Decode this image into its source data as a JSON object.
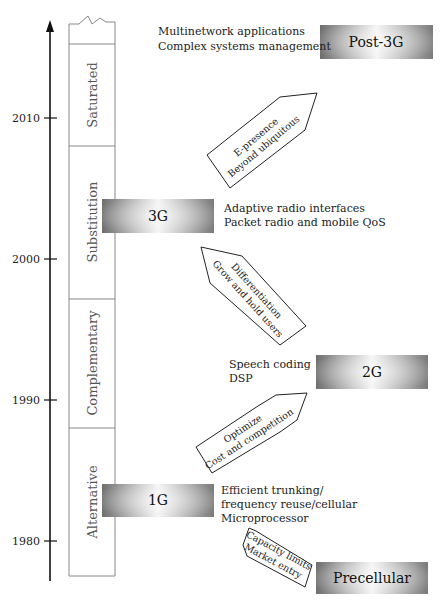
{
  "diagram": {
    "axis": {
      "ticks": [
        {
          "label": "2010",
          "y": 118
        },
        {
          "label": "2000",
          "y": 259
        },
        {
          "label": "1990",
          "y": 400
        },
        {
          "label": "1980",
          "y": 541
        }
      ]
    },
    "phases": [
      {
        "label": "Saturated",
        "y_top": 44,
        "y_bottom": 146
      },
      {
        "label": "Substitution",
        "y_top": 146,
        "y_bottom": 299
      },
      {
        "label": "Complementary",
        "y_top": 299,
        "y_bottom": 428
      },
      {
        "label": "Alternative",
        "y_top": 428,
        "y_bottom": 576
      }
    ],
    "generations": [
      {
        "id": "post3g",
        "label": "Post-3G",
        "features": [
          "Multinetwork applications",
          "Complex systems management"
        ]
      },
      {
        "id": "3g",
        "label": "3G",
        "features": [
          "Adaptive radio interfaces",
          "Packet radio and mobile QoS"
        ]
      },
      {
        "id": "2g",
        "label": "2G",
        "features": [
          "Speech coding",
          "DSP"
        ]
      },
      {
        "id": "1g",
        "label": "1G",
        "features": [
          "Efficient trunking/",
          "frequency reuse/cellular",
          "Microprocessor"
        ]
      },
      {
        "id": "precellular",
        "label": "Precellular",
        "features": []
      }
    ],
    "transitions": [
      {
        "id": "precellular-to-1g",
        "lines": [
          "Capacity limits",
          "Market entry"
        ]
      },
      {
        "id": "1g-to-2g",
        "lines": [
          "Optimize",
          "Cost and competition"
        ]
      },
      {
        "id": "2g-to-3g",
        "lines": [
          "Differentiation",
          "Grow and hold users"
        ]
      },
      {
        "id": "3g-to-post3g",
        "lines": [
          "E-presence",
          "Beyond ubiquitous"
        ]
      }
    ],
    "colors": {
      "axis": "#111111",
      "box_border": "#888888",
      "gen_dark": "#6e6e6e",
      "gen_light": "#f2f2f2",
      "arrow_stroke": "#222222"
    }
  }
}
